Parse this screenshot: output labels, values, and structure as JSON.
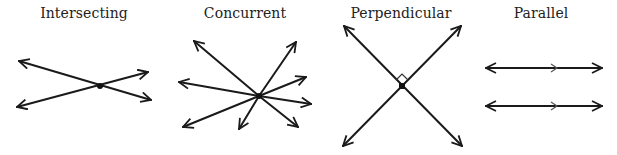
{
  "diagrams": [
    {
      "id": "intersecting",
      "label": "Intersecting",
      "label_x": 84
    },
    {
      "id": "concurrent",
      "label": "Concurrent",
      "label_x": 245
    },
    {
      "id": "perpendicular",
      "label": "Perpendicular",
      "label_x": 401
    },
    {
      "id": "parallel",
      "label": "Parallel",
      "label_x": 541
    }
  ],
  "colors": {
    "line": "#1a1a1a",
    "text": "#222222",
    "background": "#ffffff"
  }
}
